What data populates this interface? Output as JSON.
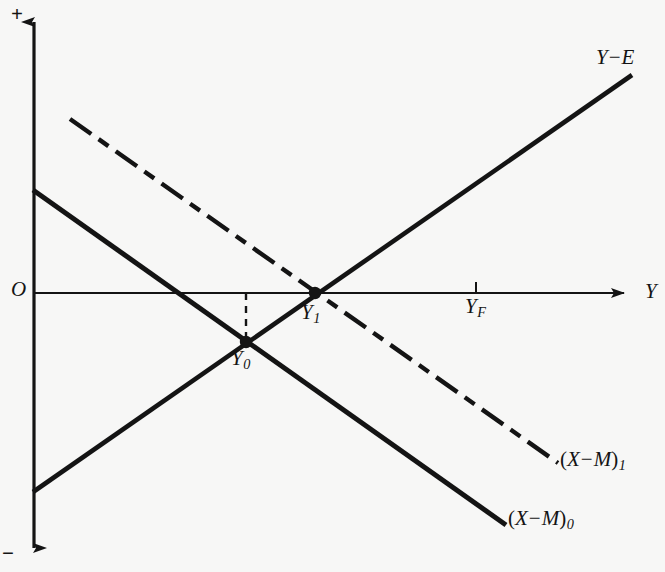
{
  "figure": {
    "type": "economics-line-diagram",
    "background_color": "#f7f7f6",
    "ink_color": "#141414",
    "width": 665,
    "height": 572
  },
  "axes": {
    "vertical": {
      "name": "vertical-axis",
      "top_sign": "+",
      "bottom_sign": "−",
      "origin_label": "O",
      "x": 34,
      "y_top": 10,
      "y_bottom": 560
    },
    "horizontal": {
      "name": "horizontal-axis",
      "variable_label": "Y",
      "y": 293,
      "x_left": 34,
      "x_right": 637
    }
  },
  "curves": [
    {
      "id": "ye",
      "label_main": "Y",
      "label_op": "−",
      "label_tail": "E",
      "style": "solid",
      "x1": 33,
      "y1": 492,
      "x2": 632,
      "y2": 75
    },
    {
      "id": "xm0",
      "label_paren_open": "(",
      "label_main": "X",
      "label_op": "−",
      "label_tail": "M",
      "label_paren_close": ")",
      "label_sub": "0",
      "style": "solid",
      "x1": 33,
      "y1": 190,
      "x2": 506,
      "y2": 525
    },
    {
      "id": "xm1",
      "label_paren_open": "(",
      "label_main": "X",
      "label_op": "−",
      "label_tail": "M",
      "label_paren_close": ")",
      "label_sub": "1",
      "style": "dash-dot",
      "x1": 70,
      "y1": 119,
      "x2": 558,
      "y2": 463
    }
  ],
  "points": [
    {
      "id": "y0",
      "label_main": "Y",
      "label_sub": "0",
      "x": 246,
      "y": 342,
      "marker": "filled-dot",
      "description": "intersection of Y−E and (X−M)₀, below the horizontal axis"
    },
    {
      "id": "y1",
      "label_main": "Y",
      "label_sub": "1",
      "x": 315,
      "y": 293,
      "marker": "filled-dot",
      "description": "intersection of Y−E and (X−M)₁, on the horizontal axis"
    }
  ],
  "ticks": [
    {
      "id": "yf",
      "label_main": "Y",
      "label_sub": "F",
      "x": 476,
      "axis": "horizontal",
      "description": "full-employment income level tick"
    }
  ],
  "guides": [
    {
      "id": "y0-drop",
      "style": "dashed",
      "x1": 246,
      "y1": 293,
      "x2": 246,
      "y2": 342,
      "description": "dashed vertical connector from axis down to Y₀"
    }
  ]
}
